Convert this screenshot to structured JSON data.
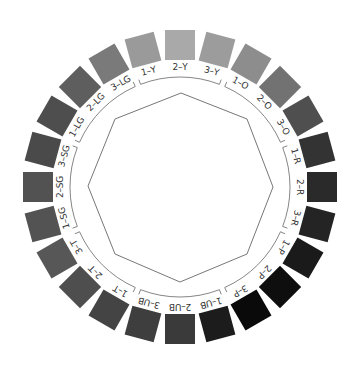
{
  "diagram": {
    "title": "",
    "center": [
      180,
      187
    ],
    "swatch_radius": 142,
    "label_radius": 120,
    "bracket_radius": 110,
    "swatches": [
      {
        "label": "2-Y",
        "angle": 0,
        "color": "#a9a9a9"
      },
      {
        "label": "3-Y",
        "angle": 15,
        "color": "#9c9c9c"
      },
      {
        "label": "1-O",
        "angle": 30,
        "color": "#8d8d8d"
      },
      {
        "label": "2-O",
        "angle": 45,
        "color": "#727272"
      },
      {
        "label": "3-O",
        "angle": 60,
        "color": "#4f4f4f"
      },
      {
        "label": "1-R",
        "angle": 75,
        "color": "#333333"
      },
      {
        "label": "2-R",
        "angle": 90,
        "color": "#2a2a2a"
      },
      {
        "label": "3-R",
        "angle": 105,
        "color": "#242424"
      },
      {
        "label": "1-P",
        "angle": 120,
        "color": "#1a1a1a"
      },
      {
        "label": "2-P",
        "angle": 135,
        "color": "#0e0e0e"
      },
      {
        "label": "3-P",
        "angle": 150,
        "color": "#0a0a0a"
      },
      {
        "label": "1-UB",
        "angle": 165,
        "color": "#1c1c1c"
      },
      {
        "label": "2-UB",
        "angle": 180,
        "color": "#3a3a3a"
      },
      {
        "label": "3-UB",
        "angle": 195,
        "color": "#3e3e3e"
      },
      {
        "label": "1-T",
        "angle": 210,
        "color": "#444444"
      },
      {
        "label": "2-T",
        "angle": 225,
        "color": "#4e4e4e"
      },
      {
        "label": "3-T",
        "angle": 240,
        "color": "#575757"
      },
      {
        "label": "1-SG",
        "angle": 255,
        "color": "#535353"
      },
      {
        "label": "2-SG",
        "angle": 270,
        "color": "#525252"
      },
      {
        "label": "3-SG",
        "angle": 285,
        "color": "#4a4a4a"
      },
      {
        "label": "1-LG",
        "angle": 300,
        "color": "#4e4e4e"
      },
      {
        "label": "2-LG",
        "angle": 315,
        "color": "#5e5e5e"
      },
      {
        "label": "3-LG",
        "angle": 330,
        "color": "#7a7a7a"
      },
      {
        "label": "1-Y",
        "angle": 345,
        "color": "#9a9a9a"
      }
    ],
    "groups": [
      {
        "name": "Y",
        "start": 345,
        "end": 15
      },
      {
        "name": "O",
        "start": 30,
        "end": 60
      },
      {
        "name": "R",
        "start": 75,
        "end": 105
      },
      {
        "name": "P",
        "start": 120,
        "end": 150
      },
      {
        "name": "UB",
        "start": 165,
        "end": 195
      },
      {
        "name": "T",
        "start": 210,
        "end": 240
      },
      {
        "name": "SG",
        "start": 255,
        "end": 285
      },
      {
        "name": "LG",
        "start": 300,
        "end": 330
      }
    ],
    "octagon": {
      "points": [
        [
          181,
          93
        ],
        [
          247,
          119
        ],
        [
          273,
          187
        ],
        [
          247,
          254
        ],
        [
          180,
          282
        ],
        [
          115,
          254
        ],
        [
          88,
          186
        ],
        [
          115,
          119
        ]
      ],
      "stroke": "#777777"
    },
    "bracket_color": "#666666"
  }
}
